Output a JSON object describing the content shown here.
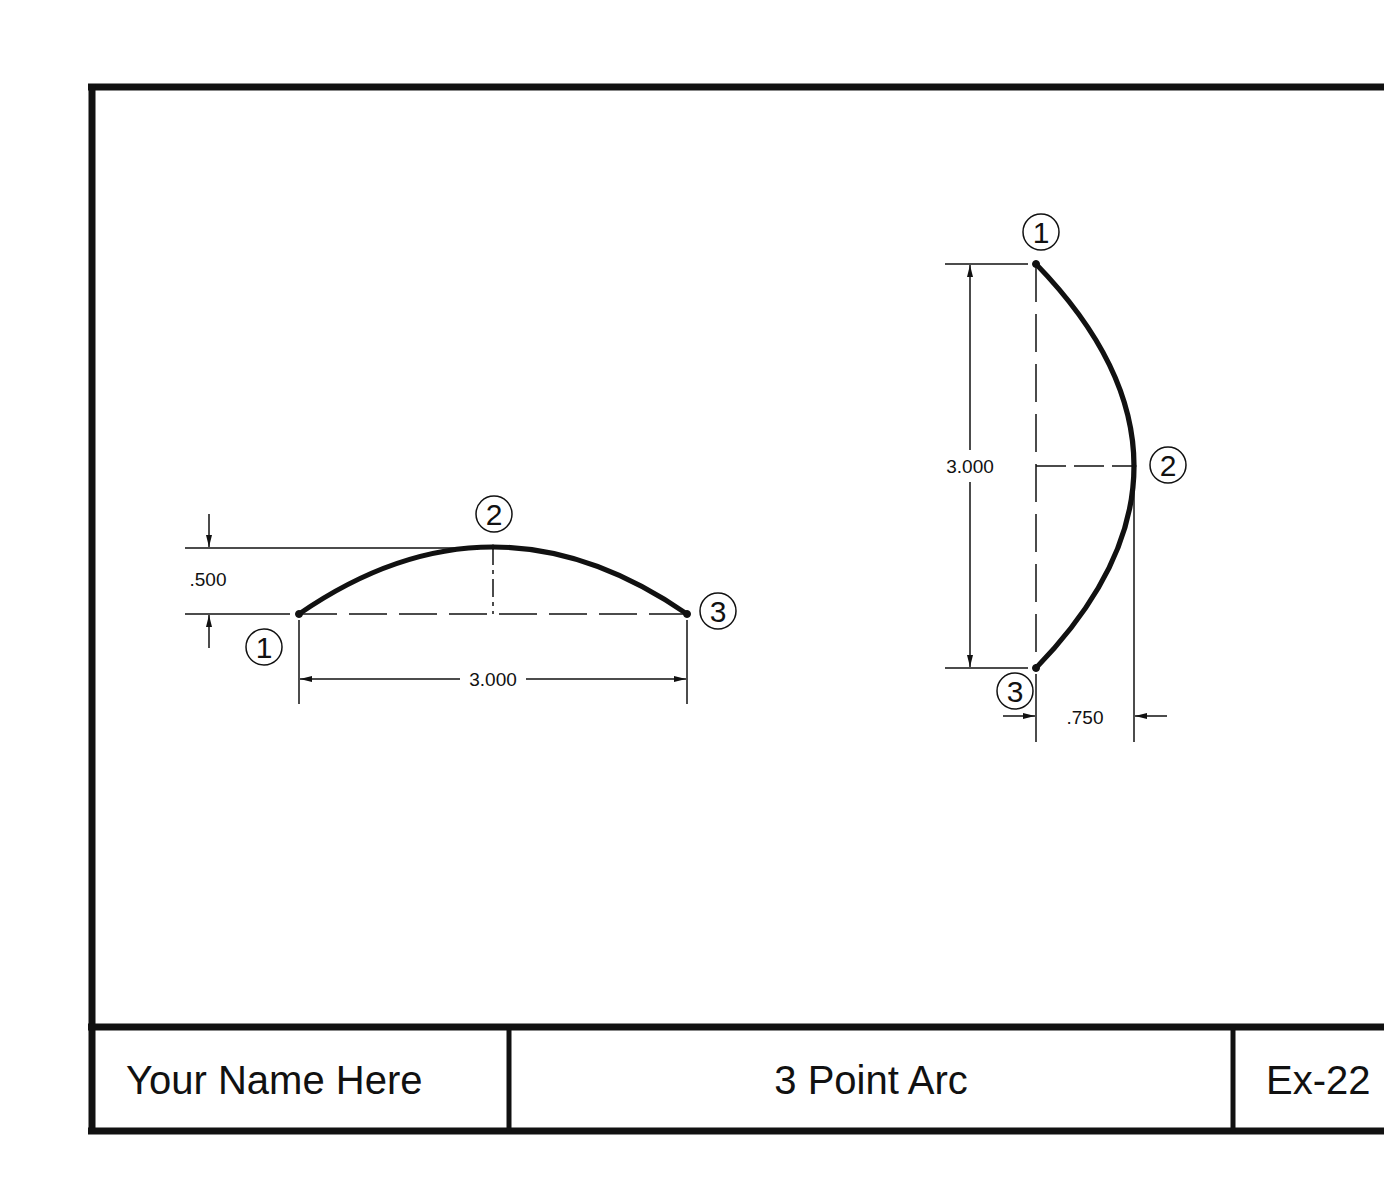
{
  "title_block": {
    "name": "Your Name Here",
    "title": "3 Point Arc",
    "exercise": "Ex-22"
  },
  "drawing_left": {
    "point_labels": [
      "1",
      "2",
      "3"
    ],
    "dim_height": ".500",
    "dim_width": "3.000"
  },
  "drawing_right": {
    "point_labels": [
      "1",
      "2",
      "3"
    ],
    "dim_height": "3.000",
    "dim_offset": ".750"
  },
  "colors": {
    "line": "#111111",
    "background": "#ffffff"
  }
}
